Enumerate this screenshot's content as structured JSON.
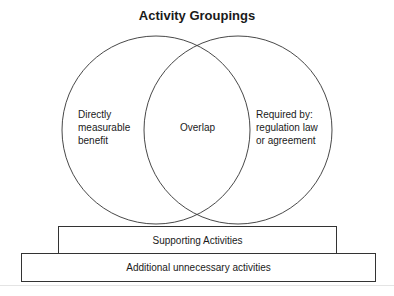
{
  "title": "Activity Groupings",
  "venn": {
    "left_circle": {
      "label_lines": [
        "Directly",
        "measurable",
        "benefit"
      ]
    },
    "overlap": {
      "label": "Overlap"
    },
    "right_circle": {
      "label_lines": [
        "Required by:",
        "regulation law",
        "or agreement"
      ]
    }
  },
  "layers": {
    "supporting": "Supporting Activities",
    "additional": "Additional unnecessary activities"
  },
  "colors": {
    "stroke": "#333333",
    "background": "#ffffff"
  }
}
